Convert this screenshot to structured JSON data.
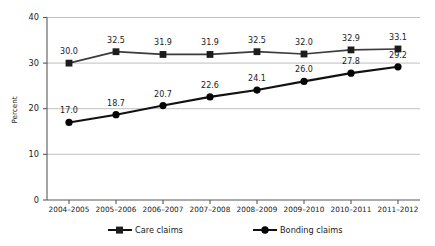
{
  "chart_data": {
    "type": "line",
    "title": "",
    "xlabel": "",
    "ylabel": "Percent",
    "ylim": [
      0,
      40
    ],
    "yticks": [
      0,
      10,
      20,
      30,
      40
    ],
    "grid": true,
    "legend_position": "bottom",
    "categories": [
      "2004–2005",
      "2005–2006",
      "2006–2007",
      "2007–2008",
      "2008–2009",
      "2009–2010",
      "2010–2011",
      "2011–2012"
    ],
    "series": [
      {
        "name": "Care claims",
        "marker": "square",
        "color": "#3b3b3b",
        "values": [
          30.0,
          32.5,
          31.9,
          31.9,
          32.5,
          32.0,
          32.9,
          33.1
        ],
        "labels": [
          "30.0",
          "32.5",
          "31.9",
          "31.9",
          "32.5",
          "32.0",
          "32.9",
          "33.1"
        ]
      },
      {
        "name": "Bonding claims",
        "marker": "circle",
        "color": "#111111",
        "values": [
          17.0,
          18.7,
          20.7,
          22.6,
          24.1,
          26.0,
          27.8,
          29.2
        ],
        "labels": [
          "17.0",
          "18.7",
          "20.7",
          "22.6",
          "24.1",
          "26.0",
          "27.8",
          "29.2"
        ]
      }
    ]
  },
  "axis": {
    "y_tick_labels": [
      "40",
      "30",
      "20",
      "10",
      "0"
    ],
    "y_title": "Percent"
  },
  "legend": {
    "items": [
      {
        "label": "Care claims",
        "marker": "square-marker"
      },
      {
        "label": "Bonding claims",
        "marker": "circle-marker"
      }
    ]
  }
}
